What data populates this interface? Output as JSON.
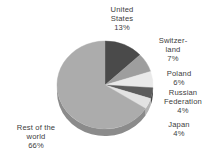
{
  "chart_data": {
    "type": "pie",
    "title": "",
    "subtitle": "",
    "xlabel": "",
    "ylabel": "",
    "legend_position": "none",
    "grid": false,
    "value_unit": "percent",
    "start_angle_deg": 0,
    "direction": "clockwise",
    "three_d": true,
    "categories": [
      "United States",
      "Switzerland",
      "Poland",
      "Russian Federation",
      "Japan",
      "Rest of the world"
    ],
    "values": [
      13,
      7,
      6,
      4,
      4,
      66
    ],
    "slices": [
      {
        "name": "United States",
        "label_lines": "United\nStates\n13%",
        "value": 13,
        "value_text": "13%",
        "color": "#4a4a4a",
        "side_color": "#343434",
        "start_pct": 0,
        "end_pct": 13
      },
      {
        "name": "Switzerland",
        "label_lines": "Switzer-\nland\n7%",
        "value": 7,
        "value_text": "7%",
        "color": "#9e9e9e",
        "side_color": "#7d7d7d",
        "start_pct": 13,
        "end_pct": 20
      },
      {
        "name": "Poland",
        "label_lines": "Poland\n6%",
        "value": 6,
        "value_text": "6%",
        "color": "#e9e9e9",
        "side_color": "#bdbdbd",
        "start_pct": 20,
        "end_pct": 26
      },
      {
        "name": "Russian Federation",
        "label_lines": "Russian\nFederation\n4%",
        "value": 4,
        "value_text": "4%",
        "color": "#5c5c5c",
        "side_color": "#454545",
        "start_pct": 26,
        "end_pct": 30
      },
      {
        "name": "Japan",
        "label_lines": "Japan\n4%",
        "value": 4,
        "value_text": "4%",
        "color": "#e2e2e2",
        "side_color": "#b4b4b4",
        "start_pct": 30,
        "end_pct": 34
      },
      {
        "name": "Rest of the world",
        "label_lines": "Rest of the\nworld\n66%",
        "value": 66,
        "value_text": "66%",
        "color": "#acacac",
        "side_color": "#8b8b8b",
        "start_pct": 34,
        "end_pct": 100
      }
    ],
    "geometry": {
      "center_x": 105,
      "center_y": 85,
      "radius_x": 48,
      "radius_y": 44,
      "depth": 7
    },
    "background": "#ffffff"
  }
}
